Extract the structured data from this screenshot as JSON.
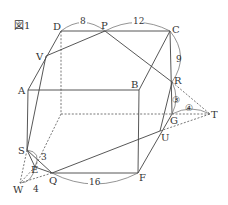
{
  "figure": {
    "caption": "図1",
    "vertices": {
      "A": "A",
      "B": "B",
      "C": "C",
      "D": "D",
      "E": "E",
      "F": "F",
      "G": "G",
      "P": "P",
      "Q": "Q",
      "R": "R",
      "S": "S",
      "T": "T",
      "U": "U",
      "V": "V",
      "W": "W"
    },
    "measurements": {
      "DP": "8",
      "PC": "12",
      "CR": "9",
      "ES": "3",
      "EW": "4",
      "QF": "16",
      "RG_circled": "③",
      "GT_circled": "④"
    }
  }
}
